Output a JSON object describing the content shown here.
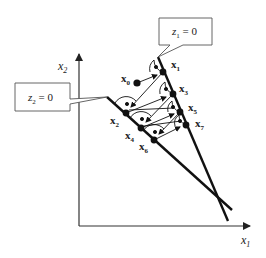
{
  "axes": {
    "x_label": "x",
    "x_sub": "1",
    "y_label": "x",
    "y_sub": "2"
  },
  "callouts": [
    {
      "id": "z1",
      "var": "z",
      "sub": "1",
      "eq": " = 0"
    },
    {
      "id": "z2",
      "var": "z",
      "sub": "2",
      "eq": " = 0"
    }
  ],
  "points": [
    {
      "name": "x",
      "sub": "0"
    },
    {
      "name": "x",
      "sub": "1"
    },
    {
      "name": "x",
      "sub": "2"
    },
    {
      "name": "x",
      "sub": "3"
    },
    {
      "name": "x",
      "sub": "4"
    },
    {
      "name": "x",
      "sub": "5"
    },
    {
      "name": "x",
      "sub": "6"
    },
    {
      "name": "x",
      "sub": "7"
    }
  ],
  "colors": {
    "line": "#111111",
    "axis": "#333333",
    "box": "#555555"
  }
}
